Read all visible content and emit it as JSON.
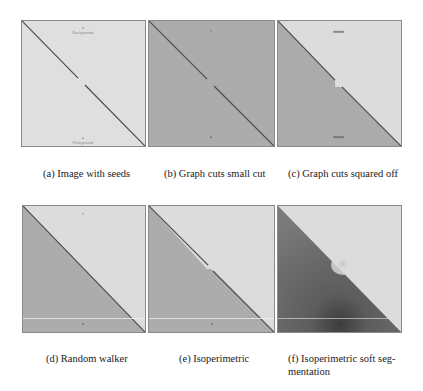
{
  "figure": {
    "panels": [
      {
        "id": "a",
        "caption": "(a) Image with seeds",
        "seeds": {
          "background_label": "Background",
          "foreground_label": "Foreground"
        }
      },
      {
        "id": "b",
        "caption": "(b) Graph cuts small cut"
      },
      {
        "id": "c",
        "caption": "(c) Graph cuts squared off"
      },
      {
        "id": "d",
        "caption": "(d) Random walker"
      },
      {
        "id": "e",
        "caption": "(e) Isoperimetric"
      },
      {
        "id": "f",
        "caption": "(f) Isoperimetric soft seg- mentation"
      }
    ],
    "colors": {
      "light_region": "#dcdcdc",
      "dark_region": "#acacac",
      "boundary_line": "#4a4a4a",
      "border": "#8a8a8a",
      "soft_dark": "#6a6a6a"
    }
  }
}
